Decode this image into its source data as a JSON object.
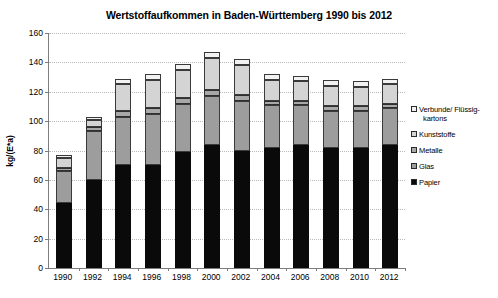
{
  "chart_data": {
    "type": "bar",
    "variant": "stacked-vertical",
    "title": "Wertstoffaufkommen in Baden-Württemberg 1990 bis 2012",
    "xlabel": "",
    "ylabel": "kg/(E*a)",
    "ylim": [
      0,
      160
    ],
    "ytick_step": 20,
    "yticks": [
      160,
      140,
      120,
      100,
      80,
      60,
      40,
      20,
      0
    ],
    "grid": "horizontal-dotted",
    "legend_position": "right",
    "categories": [
      "1990",
      "1992",
      "1994",
      "1996",
      "1998",
      "2000",
      "2002",
      "2004",
      "2006",
      "2008",
      "2010",
      "2012"
    ],
    "stack_order_bottom_to_top": [
      "Papier",
      "Glas",
      "Metalle",
      "Kunststoffe",
      "Verbunde/ Flüssigkartons"
    ],
    "series": [
      {
        "name": "Papier",
        "color": "#0a0a0a",
        "values": [
          44,
          60,
          70,
          70,
          79,
          84,
          80,
          82,
          84,
          82,
          82,
          84
        ]
      },
      {
        "name": "Glas",
        "color": "#9d9d9d",
        "values": [
          22,
          33,
          33,
          35,
          33,
          33,
          34,
          29,
          27,
          25,
          25,
          25
        ]
      },
      {
        "name": "Metalle",
        "color": "#a8a8a8",
        "values": [
          2,
          3,
          4,
          4,
          4,
          4,
          4,
          3,
          3,
          3,
          3,
          3
        ]
      },
      {
        "name": "Kunststoffe",
        "color": "#d4d4d4",
        "values": [
          7,
          5,
          18,
          19,
          19,
          22,
          20,
          14,
          13,
          14,
          13,
          13
        ]
      },
      {
        "name": "Verbunde/ Flüssigkartons",
        "color": "#f2f2f2",
        "values": [
          2,
          2,
          4,
          4,
          4,
          4,
          4,
          4,
          4,
          4,
          4,
          4
        ]
      }
    ],
    "totals": [
      77,
      103,
      129,
      132,
      139,
      147,
      142,
      132,
      131,
      128,
      127,
      129
    ]
  },
  "legend": {
    "items": [
      {
        "label_line1": "Verbunde/ Flüssig-",
        "label_line2": "kartons",
        "color": "#f2f2f2"
      },
      {
        "label_line1": "Kunststoffe",
        "label_line2": "",
        "color": "#d4d4d4"
      },
      {
        "label_line1": "Metalle",
        "label_line2": "",
        "color": "#a8a8a8"
      },
      {
        "label_line1": "Glas",
        "label_line2": "",
        "color": "#9d9d9d"
      },
      {
        "label_line1": "Papier",
        "label_line2": "",
        "color": "#0a0a0a"
      }
    ]
  }
}
